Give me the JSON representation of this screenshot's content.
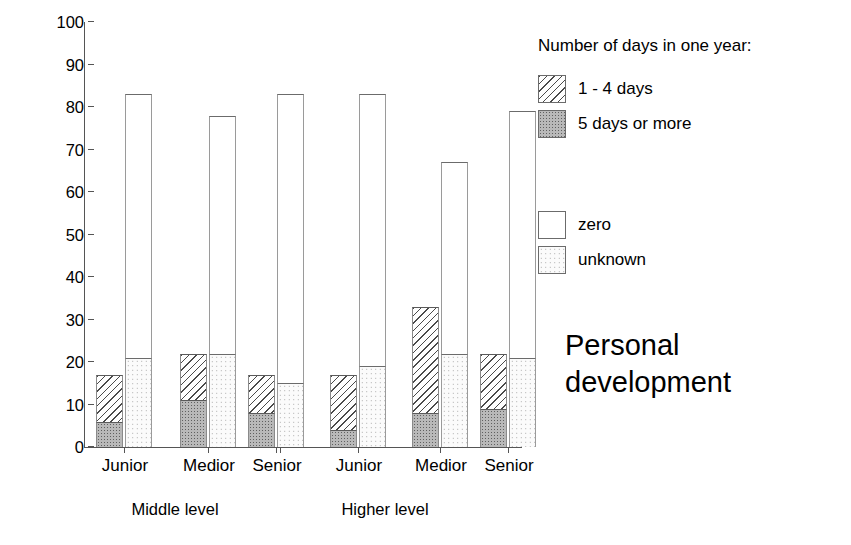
{
  "chart_data": {
    "type": "bar",
    "title": "Personal development",
    "xlabel": "",
    "ylabel": "Percentage",
    "ylim": [
      0,
      100
    ],
    "ytick_values": [
      0,
      10,
      20,
      30,
      40,
      50,
      60,
      70,
      80,
      90,
      100
    ],
    "ytick_labels": [
      "0",
      "10",
      "20",
      "30",
      "40",
      "50",
      "60",
      "70",
      "80",
      "90",
      "100"
    ],
    "grid": false,
    "stacked": true,
    "legend_position": "right",
    "legend_title": "Number of days in one year:",
    "legend_entries": [
      {
        "label": "1 - 4 days",
        "pattern": "diagonal-hatch"
      },
      {
        "label": "5 days or more",
        "pattern": "dark-stipple"
      },
      {
        "label": "zero",
        "pattern": "empty-white"
      },
      {
        "label": "unknown",
        "pattern": "light-stipple"
      }
    ],
    "group_labels": [
      "Middle level",
      "Higher level"
    ],
    "categories": [
      "Junior",
      "Medior",
      "Senior",
      "Junior",
      "Medior",
      "Senior"
    ],
    "series": [
      {
        "name": "5 days or more",
        "values": [
          6,
          11,
          8,
          4,
          8,
          9
        ]
      },
      {
        "name": "1 - 4 days",
        "values": [
          11,
          11,
          9,
          13,
          25,
          13
        ]
      },
      {
        "name": "zero",
        "values": [
          62,
          56,
          68,
          64,
          45,
          58
        ]
      },
      {
        "name": "unknown",
        "values": [
          21,
          22,
          15,
          19,
          22,
          21
        ]
      }
    ],
    "bars": [
      {
        "group": "Middle level",
        "category": "Junior",
        "left_bar": {
          "total": 17,
          "five_or_more": 6,
          "one_to_four": 11
        },
        "right_bar": {
          "total": 83,
          "unknown": 21,
          "zero": 62
        }
      },
      {
        "group": "Middle level",
        "category": "Medior",
        "left_bar": {
          "total": 22,
          "five_or_more": 11,
          "one_to_four": 11
        },
        "right_bar": {
          "total": 78,
          "unknown": 22,
          "zero": 56
        }
      },
      {
        "group": "Middle level",
        "category": "Senior",
        "left_bar": {
          "total": 17,
          "five_or_more": 8,
          "one_to_four": 9
        },
        "right_bar": {
          "total": 83,
          "unknown": 15,
          "zero": 68
        }
      },
      {
        "group": "Higher level",
        "category": "Junior",
        "left_bar": {
          "total": 17,
          "five_or_more": 4,
          "one_to_four": 13
        },
        "right_bar": {
          "total": 83,
          "unknown": 19,
          "zero": 64
        }
      },
      {
        "group": "Higher level",
        "category": "Medior",
        "left_bar": {
          "total": 33,
          "five_or_more": 8,
          "one_to_four": 25
        },
        "right_bar": {
          "total": 67,
          "unknown": 22,
          "zero": 45
        }
      },
      {
        "group": "Higher level",
        "category": "Senior",
        "left_bar": {
          "total": 22,
          "five_or_more": 9,
          "one_to_four": 13
        },
        "right_bar": {
          "total": 79,
          "unknown": 21,
          "zero": 58
        }
      }
    ],
    "colors": {
      "axis": "#555555",
      "outline": "#6b6b6b",
      "hatch_ink": "#4a4a4a",
      "dark_fill": "#b9b9b9",
      "light_fill": "#fbfbfb",
      "text": "#000000"
    }
  }
}
